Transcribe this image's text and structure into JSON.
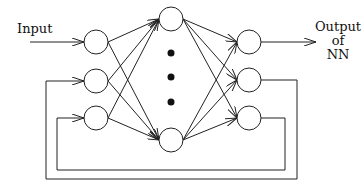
{
  "diagram": {
    "type": "recurrent-neural-network",
    "labels": {
      "input": "Input",
      "output_line1": "Output",
      "output_line2": "of",
      "output_line3": "NN"
    },
    "layers": [
      {
        "name": "input",
        "nodes": 3
      },
      {
        "name": "hidden",
        "nodes": "2 shown + ellipsis (3 dots)"
      },
      {
        "name": "output",
        "nodes": 3
      }
    ],
    "connections": [
      "Input -> input node 1",
      "input layer fully connected to hidden layer",
      "hidden layer fully connected to output layer",
      "output node 1 -> Output of NN",
      "output node 2 -> feedback -> input node 2",
      "output node 3 -> feedback -> input node 3"
    ],
    "colors": {
      "stroke": "#222222",
      "background": "#ffffff"
    }
  }
}
